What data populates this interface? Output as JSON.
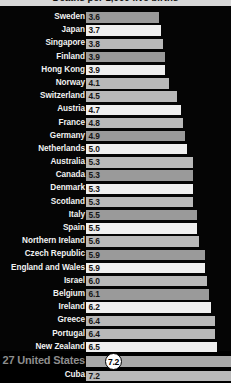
{
  "header": {
    "title": "Deaths per 1,000 live births"
  },
  "highlight": {
    "rank": "27",
    "label": "27 United States",
    "circled_value": "7.2",
    "color": "#8d8d8d"
  },
  "chart_data": {
    "type": "bar",
    "orientation": "horizontal",
    "title": "Deaths per 1,000 live births",
    "xlabel": "",
    "ylabel": "",
    "grid": false,
    "legend": false,
    "xlim": [
      0,
      7.2
    ],
    "categories": [
      "Sweden",
      "Japan",
      "Singapore",
      "Finland",
      "Hong Kong",
      "Norway",
      "Switzerland",
      "Austria",
      "France",
      "Germany",
      "Netherlands",
      "Australia",
      "Canada",
      "Denmark",
      "Scotland",
      "Italy",
      "Spain",
      "Northern Ireland",
      "Czech Republic",
      "England and Wales",
      "Israel",
      "Belgium",
      "Ireland",
      "Greece",
      "Portugal",
      "New Zealand",
      "United States",
      "Cuba"
    ],
    "values": [
      3.6,
      3.7,
      3.8,
      3.9,
      3.9,
      4.1,
      4.5,
      4.7,
      4.8,
      4.9,
      5.0,
      5.3,
      5.3,
      5.3,
      5.3,
      5.5,
      5.5,
      5.6,
      5.9,
      5.9,
      6.0,
      6.1,
      6.2,
      6.4,
      6.4,
      6.5,
      7.2,
      7.2
    ],
    "value_labels": [
      "3.6",
      "3.7",
      "3.8",
      "3.9",
      "3.9",
      "4.1",
      "4.5",
      "4.7",
      "4.8",
      "4.9",
      "5.0",
      "5.3",
      "5.3",
      "5.3",
      "5.3",
      "5.5",
      "5.5",
      "5.6",
      "5.9",
      "5.9",
      "6.0",
      "6.1",
      "6.2",
      "6.4",
      "6.4",
      "6.5",
      "7.2",
      "7.2"
    ]
  },
  "rows": [
    {
      "label": "Sweden",
      "value": "3.6",
      "num": 3.6,
      "shade": "dim",
      "show_value": true
    },
    {
      "label": "Japan",
      "value": "3.7",
      "num": 3.7,
      "shade": "alt",
      "show_value": true
    },
    {
      "label": "Singapore",
      "value": "3.8",
      "num": 3.8,
      "shade": "mid",
      "show_value": true
    },
    {
      "label": "Finland",
      "value": "3.9",
      "num": 3.9,
      "shade": "dim",
      "show_value": true
    },
    {
      "label": "Hong Kong",
      "value": "3.9",
      "num": 3.9,
      "shade": "alt",
      "show_value": true
    },
    {
      "label": "Norway",
      "value": "4.1",
      "num": 4.1,
      "shade": "mid",
      "show_value": true
    },
    {
      "label": "Switzerland",
      "value": "4.5",
      "num": 4.5,
      "shade": "mid",
      "show_value": true
    },
    {
      "label": "Austria",
      "value": "4.7",
      "num": 4.7,
      "shade": "alt",
      "show_value": true
    },
    {
      "label": "France",
      "value": "4.8",
      "num": 4.8,
      "shade": "mid",
      "show_value": true
    },
    {
      "label": "Germany",
      "value": "4.9",
      "num": 4.9,
      "shade": "dim",
      "show_value": true
    },
    {
      "label": "Netherlands",
      "value": "5.0",
      "num": 5.0,
      "shade": "alt",
      "show_value": true
    },
    {
      "label": "Australia",
      "value": "5.3",
      "num": 5.3,
      "shade": "mid",
      "show_value": true
    },
    {
      "label": "Canada",
      "value": "5.3",
      "num": 5.3,
      "shade": "dim",
      "show_value": true
    },
    {
      "label": "Denmark",
      "value": "5.3",
      "num": 5.3,
      "shade": "alt",
      "show_value": true
    },
    {
      "label": "Scotland",
      "value": "5.3",
      "num": 5.3,
      "shade": "mid",
      "show_value": true
    },
    {
      "label": "Italy",
      "value": "5.5",
      "num": 5.5,
      "shade": "dim",
      "show_value": true
    },
    {
      "label": "Spain",
      "value": "5.5",
      "num": 5.5,
      "shade": "alt",
      "show_value": true
    },
    {
      "label": "Northern Ireland",
      "value": "5.6",
      "num": 5.6,
      "shade": "mid",
      "show_value": true
    },
    {
      "label": "Czech Republic",
      "value": "5.9",
      "num": 5.9,
      "shade": "dim",
      "show_value": true
    },
    {
      "label": "England and Wales",
      "value": "5.9",
      "num": 5.9,
      "shade": "alt",
      "show_value": true
    },
    {
      "label": "Israel",
      "value": "6.0",
      "num": 6.0,
      "shade": "mid",
      "show_value": true
    },
    {
      "label": "Belgium",
      "value": "6.1",
      "num": 6.1,
      "shade": "dim",
      "show_value": true
    },
    {
      "label": "Ireland",
      "value": "6.2",
      "num": 6.2,
      "shade": "alt",
      "show_value": true
    },
    {
      "label": "Greece",
      "value": "6.4",
      "num": 6.4,
      "shade": "mid",
      "show_value": true
    },
    {
      "label": "Portugal",
      "value": "6.4",
      "num": 6.4,
      "shade": "mid",
      "show_value": true
    },
    {
      "label": "New Zealand",
      "value": "6.5",
      "num": 6.5,
      "shade": "alt",
      "show_value": true
    },
    {
      "label": "27 United States",
      "value": "7.2",
      "num": 7.2,
      "shade": "mid",
      "show_value": false,
      "highlight": true
    },
    {
      "label": "Cuba",
      "value": "7.2",
      "num": 7.2,
      "shade": "mid",
      "show_value": true
    }
  ]
}
